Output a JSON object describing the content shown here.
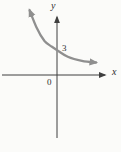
{
  "figure": {
    "background": "#fbfbf9",
    "axis_color": "#3f3f3f",
    "curve_color": "#8f8f8f",
    "label_color": "#2e2e2e"
  },
  "labels": {
    "x_axis": "x",
    "y_axis": "y",
    "origin": "0",
    "y_intercept": "3"
  },
  "chart_data": {
    "type": "line",
    "title": "",
    "xlabel": "x",
    "ylabel": "y",
    "grid": false,
    "legend": false,
    "annotations": [
      "3 marked where curve crosses y-axis",
      "0 at origin"
    ],
    "curve": {
      "description": "smooth decreasing exponential-style curve, arrowheads on both ends, y-intercept 3, approaches x-axis as x increases",
      "y_intercept": 3,
      "x": [
        -3.3,
        -2.5,
        -1.5,
        -0.6,
        0,
        1.3,
        3.0,
        4.7
      ],
      "y": [
        7.8,
        5.8,
        4.1,
        3.4,
        3.0,
        2.2,
        1.7,
        1.5
      ]
    },
    "layout": {
      "origin_px": [
        57,
        75
      ],
      "unit_px": 8.3,
      "x_axis_px": {
        "from": 2,
        "to": 105,
        "y": 75
      },
      "y_axis_px": {
        "from": 138,
        "to": 17,
        "x": 57
      }
    }
  }
}
